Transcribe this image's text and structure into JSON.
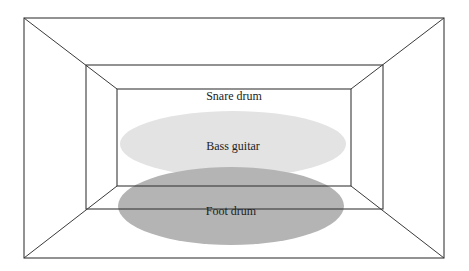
{
  "diagram": {
    "type": "perspective-room-stage-layout",
    "colors": {
      "background": "#ffffff",
      "line": "#3a3a3a",
      "bass_guitar_fill": "#e3e3e3",
      "foot_drum_fill": "#b4b4b4",
      "text": "#222222"
    },
    "rectangles": {
      "outer": {
        "x1": 24,
        "y1": 18,
        "x2": 444,
        "y2": 258
      },
      "middle": {
        "x1": 86,
        "y1": 65,
        "x2": 383,
        "y2": 209
      },
      "inner": {
        "x1": 117,
        "y1": 89,
        "x2": 351,
        "y2": 186
      }
    },
    "regions": [
      {
        "id": "snare-drum",
        "label": "Snare drum",
        "label_x": 234,
        "label_y": 96
      },
      {
        "id": "bass-guitar",
        "label": "Bass guitar",
        "cx": 233,
        "cy": 144,
        "rx": 113,
        "ry": 33,
        "label_x": 233,
        "label_y": 146
      },
      {
        "id": "foot-drum",
        "label": "Foot drum",
        "cx": 231,
        "cy": 206,
        "rx": 113,
        "ry": 39,
        "label_x": 231,
        "label_y": 211
      }
    ]
  }
}
